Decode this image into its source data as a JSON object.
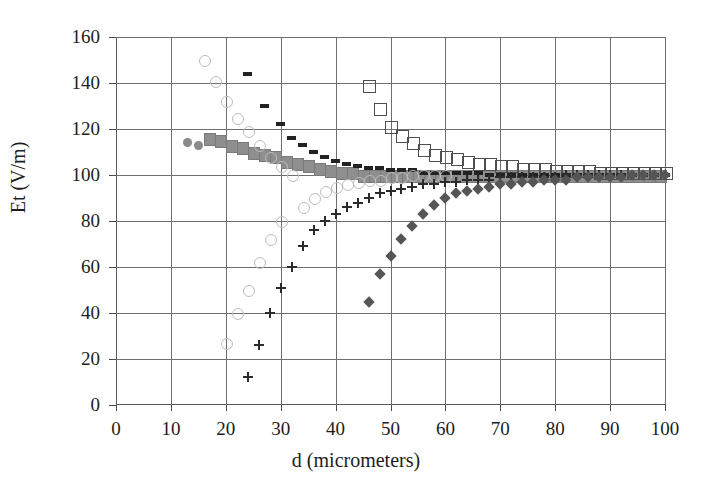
{
  "chart_data": {
    "type": "scatter",
    "title": "",
    "xlabel": "d (micrometers)",
    "ylabel": "Et (V/m)",
    "xlim": [
      0,
      100
    ],
    "ylim": [
      0,
      160
    ],
    "xticks": [
      0,
      10,
      20,
      30,
      40,
      50,
      60,
      70,
      80,
      90,
      100
    ],
    "yticks": [
      0,
      20,
      40,
      60,
      80,
      100,
      120,
      140,
      160
    ],
    "grid": true,
    "legend": "none",
    "series": [
      {
        "name": "filled-circles",
        "marker": "filled-circle",
        "color": "#8a8a8a",
        "x": [
          13,
          15,
          17,
          19,
          21,
          23,
          25,
          27,
          29,
          31,
          33,
          35,
          37,
          39
        ],
        "y": [
          114,
          113,
          116,
          115,
          113,
          111,
          110,
          109,
          107,
          106,
          105,
          104,
          103,
          102
        ]
      },
      {
        "name": "filled-squares",
        "marker": "filled-square",
        "color": "#8e8e8e",
        "x": [
          17,
          19,
          21,
          23,
          25,
          27,
          29,
          31,
          33,
          35,
          37,
          39,
          41,
          43,
          45,
          47,
          49,
          51,
          53,
          55,
          57,
          59,
          61,
          63,
          65,
          67,
          69,
          71,
          73,
          75,
          77,
          79,
          81,
          83,
          85,
          87,
          89,
          91,
          93,
          95,
          97,
          99
        ],
        "y": [
          116,
          115,
          113,
          112,
          110,
          109,
          108,
          106,
          105,
          104,
          103,
          102,
          101,
          101,
          100,
          100,
          100,
          100,
          100,
          100,
          100,
          100,
          100,
          100,
          100,
          100,
          100,
          100,
          100,
          100,
          100,
          100,
          100,
          100,
          100,
          100,
          100,
          100,
          100,
          100,
          100,
          100
        ]
      },
      {
        "name": "open-squares",
        "marker": "open-square",
        "color": "#4f4f4f",
        "x": [
          46,
          48,
          50,
          52,
          54,
          56,
          58,
          60,
          62,
          64,
          66,
          68,
          70,
          72,
          74,
          76,
          78,
          80,
          82,
          84,
          86,
          88,
          90,
          92,
          94,
          96,
          98,
          100
        ],
        "y": [
          139,
          129,
          121,
          117,
          114,
          111,
          109,
          108,
          107,
          106,
          105,
          105,
          104,
          104,
          103,
          103,
          103,
          102,
          102,
          102,
          102,
          101,
          101,
          101,
          101,
          101,
          101,
          101
        ]
      },
      {
        "name": "dashes",
        "marker": "dash",
        "color": "#222222",
        "x": [
          24,
          27,
          30,
          32,
          34,
          36,
          38,
          40,
          42,
          44,
          46,
          48,
          50,
          52,
          54,
          56,
          58,
          60,
          62,
          64,
          66,
          68,
          70,
          72,
          74,
          76,
          78,
          80,
          82,
          84,
          86,
          88,
          90,
          92,
          94,
          96,
          98,
          100
        ],
        "y": [
          144,
          130,
          122,
          116,
          113,
          110,
          108,
          106,
          105,
          104,
          103,
          103,
          102,
          102,
          102,
          101,
          101,
          101,
          101,
          101,
          101,
          100,
          100,
          100,
          100,
          100,
          100,
          100,
          100,
          100,
          100,
          100,
          100,
          100,
          100,
          100,
          100,
          100
        ]
      },
      {
        "name": "open-circles",
        "marker": "open-circle",
        "color": "#bdbdbd",
        "x": [
          16,
          18,
          20,
          20,
          22,
          22,
          24,
          24,
          26,
          26,
          28,
          28,
          30,
          30,
          32,
          34,
          36,
          38,
          40,
          42,
          44,
          46,
          48,
          50,
          52,
          54,
          56,
          58,
          60
        ],
        "y": [
          150,
          141,
          132,
          27,
          125,
          40,
          119,
          50,
          113,
          62,
          108,
          72,
          104,
          80,
          100,
          86,
          90,
          93,
          95,
          96,
          97,
          98,
          98,
          99,
          99,
          100,
          100,
          100,
          100
        ]
      },
      {
        "name": "plus-markers",
        "marker": "plus",
        "color": "#2b2b2b",
        "x": [
          24,
          26,
          28,
          30,
          32,
          34,
          36,
          38,
          40,
          42,
          44,
          46,
          48,
          50,
          52,
          54,
          56,
          58,
          60,
          62,
          64,
          66,
          68,
          70,
          72,
          74,
          76,
          78,
          80,
          82,
          84,
          86,
          88,
          90,
          92,
          94,
          96,
          98,
          100
        ],
        "y": [
          12,
          26,
          40,
          51,
          60,
          69,
          76,
          80,
          83,
          86,
          88,
          90,
          92,
          93,
          94,
          95,
          96,
          96,
          97,
          97,
          98,
          98,
          98,
          99,
          99,
          99,
          99,
          99,
          99,
          100,
          100,
          100,
          100,
          100,
          100,
          100,
          100,
          100,
          100
        ]
      },
      {
        "name": "filled-diamonds",
        "marker": "filled-diamond",
        "color": "#555555",
        "x": [
          46,
          48,
          50,
          52,
          54,
          56,
          58,
          60,
          62,
          64,
          66,
          68,
          70,
          72,
          74,
          76,
          78,
          80,
          82,
          84,
          86,
          88,
          90,
          92,
          94,
          96,
          98,
          100
        ],
        "y": [
          45,
          57,
          65,
          72,
          78,
          83,
          87,
          90,
          92,
          93,
          94,
          95,
          96,
          96,
          97,
          97,
          98,
          98,
          98,
          99,
          99,
          99,
          99,
          99,
          100,
          100,
          100,
          100
        ]
      }
    ]
  }
}
